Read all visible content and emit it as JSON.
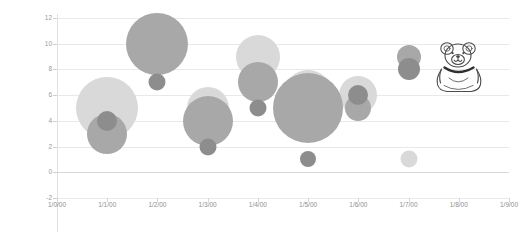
{
  "chart_data": {
    "type": "scatter",
    "title": "",
    "xlabel": "",
    "ylabel": "",
    "xlim": [
      "1/0/00",
      "1/9/00"
    ],
    "ylim": [
      -2,
      12
    ],
    "grid": true,
    "legend": "none",
    "x_tick_labels": [
      "1/0/00",
      "1/1/00",
      "1/2/00",
      "1/3/00",
      "1/4/00",
      "1/5/00",
      "1/6/00",
      "1/7/00",
      "1/8/00",
      "1/9/00"
    ],
    "y_tick_labels": [
      "12",
      "10",
      "8",
      "6",
      "4",
      "2",
      "0",
      "-2"
    ],
    "y_ticks": [
      12,
      10,
      8,
      6,
      4,
      2,
      0,
      -2
    ],
    "series": [
      {
        "name": "Series 1",
        "color": "#d9d9d9",
        "points": [
          {
            "x": 1,
            "y": 5,
            "size": 62
          },
          {
            "x": 2,
            "y": 10,
            "size": 8
          },
          {
            "x": 3,
            "y": 5,
            "size": 42
          },
          {
            "x": 4,
            "y": 9,
            "size": 44
          },
          {
            "x": 5,
            "y": 6,
            "size": 50
          },
          {
            "x": 6,
            "y": 6,
            "size": 38
          },
          {
            "x": 7,
            "y": 9,
            "size": 10
          },
          {
            "x": 7,
            "y": 1,
            "size": 17
          }
        ]
      },
      {
        "name": "Series 2",
        "color": "#a8a8a8",
        "points": [
          {
            "x": 1,
            "y": 3,
            "size": 40
          },
          {
            "x": 2,
            "y": 10,
            "size": 62
          },
          {
            "x": 3,
            "y": 4,
            "size": 50
          },
          {
            "x": 4,
            "y": 7,
            "size": 40
          },
          {
            "x": 5,
            "y": 5,
            "size": 70
          },
          {
            "x": 6,
            "y": 5,
            "size": 26
          },
          {
            "x": 7,
            "y": 9,
            "size": 24
          }
        ]
      },
      {
        "name": "Series 3",
        "color": "#8d8d8d",
        "points": [
          {
            "x": 1,
            "y": 4,
            "size": 20
          },
          {
            "x": 2,
            "y": 7,
            "size": 17
          },
          {
            "x": 3,
            "y": 2,
            "size": 17
          },
          {
            "x": 4,
            "y": 5,
            "size": 17
          },
          {
            "x": 5,
            "y": 1,
            "size": 16
          },
          {
            "x": 6,
            "y": 6,
            "size": 20
          },
          {
            "x": 7,
            "y": 8,
            "size": 22
          }
        ]
      }
    ],
    "annotations": [
      {
        "name": "bear-sketch",
        "label": "hand-drawn teddy bear outline",
        "x": 8.2,
        "y": 8.5
      }
    ]
  }
}
